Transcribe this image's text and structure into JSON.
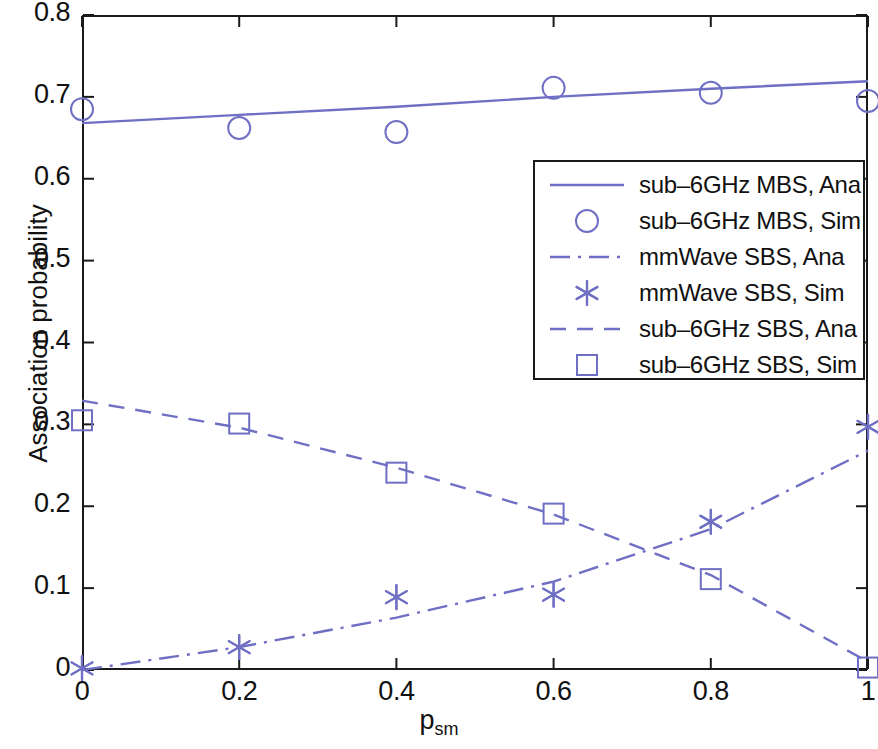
{
  "chart_data": {
    "type": "line",
    "title": "",
    "xlabel": "p_sm",
    "xlabel_base": "p",
    "xlabel_sub": "sm",
    "ylabel": "Association probability",
    "xlim": [
      0,
      1
    ],
    "ylim": [
      0,
      0.8
    ],
    "xticks": [
      "0",
      "0.2",
      "0.4",
      "0.6",
      "0.8",
      "1"
    ],
    "xtick_values": [
      0,
      0.2,
      0.4,
      0.6,
      0.8,
      1
    ],
    "yticks": [
      "0",
      "0.1",
      "0.2",
      "0.3",
      "0.4",
      "0.5",
      "0.6",
      "0.7",
      "0.8"
    ],
    "ytick_values": [
      0,
      0.1,
      0.2,
      0.3,
      0.4,
      0.5,
      0.6,
      0.7,
      0.8
    ],
    "grid": false,
    "legend_position": "center-right",
    "line_color": "#6f6fc4",
    "axis_color": "#1a1a1a",
    "x": [
      0,
      0.2,
      0.4,
      0.6,
      0.8,
      1
    ],
    "series": [
      {
        "name": "sub-6GHz MBS, Ana",
        "style": "solid",
        "marker": "none",
        "color": "#6f6fc4",
        "x": [
          0,
          0.2,
          0.4,
          0.6,
          0.8,
          1
        ],
        "values": [
          0.668,
          0.678,
          0.688,
          0.7,
          0.71,
          0.719
        ]
      },
      {
        "name": "sub-6GHz MBS, Sim",
        "style": "none",
        "marker": "circle",
        "color": "#6f6fc4",
        "x": [
          0,
          0.2,
          0.4,
          0.6,
          0.8,
          1
        ],
        "values": [
          0.685,
          0.662,
          0.657,
          0.711,
          0.705,
          0.695
        ]
      },
      {
        "name": "mmWave SBS, Ana",
        "style": "dashdot",
        "marker": "none",
        "color": "#6f6fc4",
        "x": [
          0,
          0.2,
          0.4,
          0.6,
          0.8,
          1
        ],
        "values": [
          0.0,
          0.028,
          0.064,
          0.108,
          0.172,
          0.268
        ]
      },
      {
        "name": "mmWave SBS, Sim",
        "style": "none",
        "marker": "asterisk",
        "color": "#6f6fc4",
        "x": [
          0,
          0.2,
          0.4,
          0.6,
          0.8,
          1
        ],
        "values": [
          0.002,
          0.028,
          0.089,
          0.092,
          0.181,
          0.297
        ]
      },
      {
        "name": "sub-6GHz SBS, Ana",
        "style": "dashed",
        "marker": "none",
        "color": "#6f6fc4",
        "x": [
          0,
          0.2,
          0.4,
          0.6,
          0.8,
          1
        ],
        "values": [
          0.329,
          0.296,
          0.247,
          0.19,
          0.116,
          0.01
        ]
      },
      {
        "name": "sub-6GHz SBS, Sim",
        "style": "none",
        "marker": "square",
        "color": "#6f6fc4",
        "x": [
          0,
          0.2,
          0.4,
          0.6,
          0.8,
          1
        ],
        "values": [
          0.305,
          0.301,
          0.241,
          0.191,
          0.111,
          0.003
        ]
      }
    ]
  },
  "legend": {
    "entries": [
      {
        "label": "sub–6GHz MBS, Ana",
        "sample": "solid-line"
      },
      {
        "label": "sub–6GHz MBS, Sim",
        "sample": "circle-marker"
      },
      {
        "label": "mmWave SBS, Ana",
        "sample": "dashdot-line"
      },
      {
        "label": "mmWave SBS, Sim",
        "sample": "asterisk-marker"
      },
      {
        "label": "sub–6GHz SBS, Ana",
        "sample": "dashed-line"
      },
      {
        "label": "sub–6GHz SBS, Sim",
        "sample": "square-marker"
      }
    ]
  },
  "axes": {
    "y_title": "Association probability",
    "x_title_base": "p",
    "x_title_sub": "sm",
    "yticks": [
      "0.8",
      "0.7",
      "0.6",
      "0.5",
      "0.4",
      "0.3",
      "0.2",
      "0.1",
      "0"
    ],
    "xticks": [
      "0",
      "0.2",
      "0.4",
      "0.6",
      "0.8",
      "1"
    ]
  }
}
